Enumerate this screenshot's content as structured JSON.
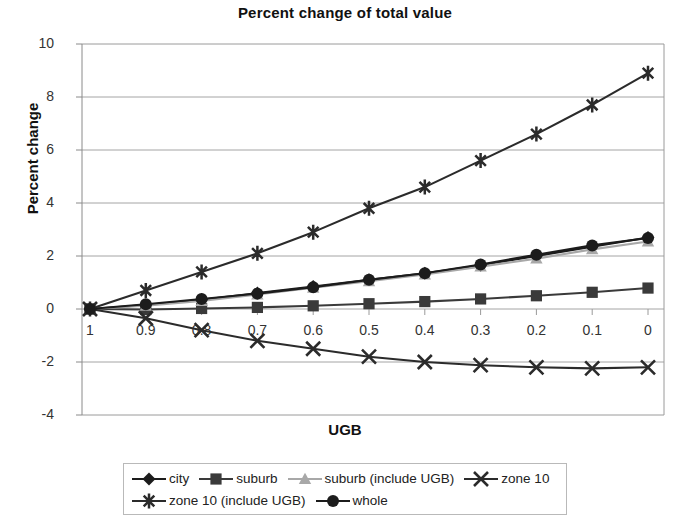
{
  "chart_data": {
    "type": "line",
    "title": "Percent change of total value",
    "xlabel": "UGB",
    "ylabel": "Percent change",
    "grid": true,
    "legend_position": "bottom",
    "x": [
      1,
      0.9,
      0.8,
      0.7,
      0.6,
      0.5,
      0.4,
      0.3,
      0.2,
      0.1,
      0
    ],
    "xtick_labels": [
      "1",
      "0.9",
      "0.8",
      "0.7",
      "0.6",
      "0.5",
      "0.4",
      "0.3",
      "0.2",
      "0.1",
      "0"
    ],
    "ytick_labels": [
      "10",
      "8",
      "6",
      "4",
      "2",
      "0",
      "-2",
      "-4"
    ],
    "ytick_values": [
      10,
      8,
      6,
      4,
      2,
      0,
      -2,
      -4
    ],
    "ylim": [
      -4,
      10
    ],
    "xlim": [
      1,
      0
    ],
    "series": [
      {
        "name": "city",
        "marker": "diamond",
        "color": "#1c1c1c",
        "values": [
          0,
          0.15,
          0.35,
          0.6,
          0.85,
          1.1,
          1.35,
          1.65,
          2.0,
          2.35,
          2.7
        ]
      },
      {
        "name": "suburb",
        "marker": "square",
        "color": "#3a3a3a",
        "values": [
          0,
          -0.02,
          0.02,
          0.06,
          0.12,
          0.2,
          0.28,
          0.38,
          0.5,
          0.63,
          0.79
        ]
      },
      {
        "name": "suburb (include UGB)",
        "marker": "triangle",
        "color": "#a8a8a8",
        "values": [
          0,
          0.12,
          0.3,
          0.55,
          0.8,
          1.05,
          1.3,
          1.6,
          1.9,
          2.25,
          2.55
        ]
      },
      {
        "name": "zone 10",
        "marker": "x",
        "color": "#2b2b2b",
        "values": [
          0,
          -0.35,
          -0.8,
          -1.2,
          -1.5,
          -1.8,
          -2.0,
          -2.12,
          -2.2,
          -2.24,
          -2.2
        ]
      },
      {
        "name": "zone 10 (include UGB)",
        "marker": "asterisk",
        "color": "#2b2b2b",
        "values": [
          0,
          0.7,
          1.4,
          2.1,
          2.9,
          3.8,
          4.6,
          5.6,
          6.6,
          7.7,
          8.9
        ]
      },
      {
        "name": "whole",
        "marker": "circle",
        "color": "#1c1c1c",
        "values": [
          0,
          0.18,
          0.38,
          0.58,
          0.82,
          1.1,
          1.35,
          1.68,
          2.05,
          2.4,
          2.68
        ]
      }
    ]
  }
}
